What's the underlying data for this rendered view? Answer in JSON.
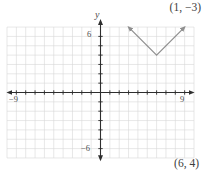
{
  "colors": {
    "axis": "#2e2e2e",
    "grid": "#d7d7d7",
    "graph": "#8f8f8f",
    "label": "#4d4d4d",
    "annotation": "#3d3d3d"
  },
  "chart_data": {
    "type": "line",
    "title": "",
    "series": [
      {
        "name": "absolute-value-graph",
        "shape": "V",
        "vertex": [
          6,
          4
        ],
        "points": [
          [
            3,
            7
          ],
          [
            6,
            4
          ],
          [
            9,
            7
          ]
        ],
        "arrows": "both",
        "slope": 1,
        "color": "#8f8f8f"
      }
    ],
    "axes": {
      "xlabel": "",
      "ylabel": "y",
      "xlim": [
        -10,
        10
      ],
      "ylim": [
        -7,
        7
      ],
      "x_axis_arrows": [
        -9.9,
        9.9
      ],
      "y_axis_arrows": [
        -7.2,
        7.7
      ],
      "tick_step": 1,
      "x_tick_range": [
        -9,
        9
      ],
      "y_tick_range": [
        -6,
        6
      ],
      "grid": true,
      "tick_labels": {
        "x_neg": "−9",
        "x_pos": "9",
        "y_pos": "6",
        "y_neg": "−6"
      }
    },
    "annotations": [
      {
        "text": "(1, −3)",
        "position": "top-right"
      },
      {
        "text": "(6, 4)",
        "position": "bottom-right"
      }
    ]
  }
}
